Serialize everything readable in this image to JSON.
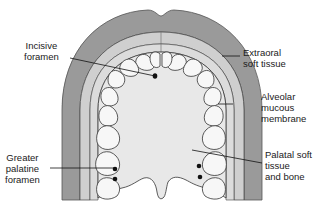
{
  "diagram": {
    "colors": {
      "extraoral": "#9a9a9a",
      "extraoral_stroke": "#555555",
      "alveolar_mucosa": "#c9c9c9",
      "palate": "#e6e6e6",
      "tooth_fill": "#f7f7f7",
      "stroke": "#333333",
      "foramen": "#111111"
    },
    "labels": {
      "incisive_foramen": "Incisive\nforamen",
      "extraoral_soft_tissue": "Extraoral\nsoft tissue",
      "alveolar_mucous_membrane": "Alveolar\nmucous\nmembrane",
      "greater_palatine_foramen": "Greater\npalatine\nforamen",
      "palatal_soft_tissue": "Palatal soft\ntissue\nand bone"
    }
  }
}
